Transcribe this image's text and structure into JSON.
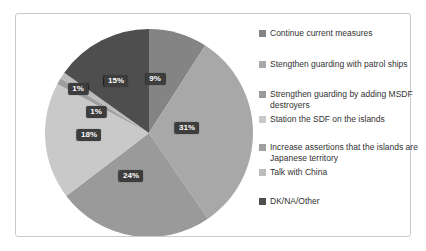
{
  "chart_data": {
    "type": "pie",
    "title": "",
    "legend_position": "right",
    "direction": "clockwise",
    "start_angle_deg": 0,
    "total": 99,
    "data_label_style": "dark box with white bold percent text",
    "slices": [
      {
        "label": "Continue current measures",
        "value": 9,
        "display": "9%",
        "color": "#848484"
      },
      {
        "label": "Stengthen guarding with patrol ships",
        "value": 31,
        "display": "31%",
        "color": "#a8a8a8"
      },
      {
        "label": "Strengthen guarding by adding MSDF destroyers",
        "value": 24,
        "display": "24%",
        "color": "#9a9a9a"
      },
      {
        "label": "Station the SDF on the islands",
        "value": 18,
        "display": "18%",
        "color": "#c9c9c9"
      },
      {
        "label": "Increase assertions that the islands are Japanese territory",
        "value": 1,
        "display": "1%",
        "color": "#9f9f9f"
      },
      {
        "label": "Talk with China",
        "value": 1,
        "display": "1%",
        "color": "#bcbcbc"
      },
      {
        "label": "DK/NA/Other",
        "value": 15,
        "display": "15%",
        "color": "#4e4e4e"
      }
    ]
  }
}
